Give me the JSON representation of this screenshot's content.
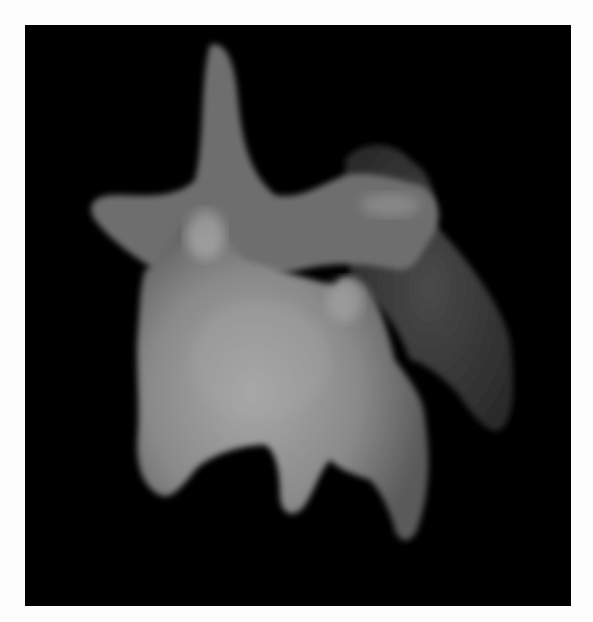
{
  "image": {
    "description": "Grayscale micrograph-style rendering of an irregular multi-lobed blob with finger-like protrusions on black background",
    "background_color": "#000000",
    "border_color": "#fdfdfd",
    "subject_color": "#9a9a9a"
  }
}
